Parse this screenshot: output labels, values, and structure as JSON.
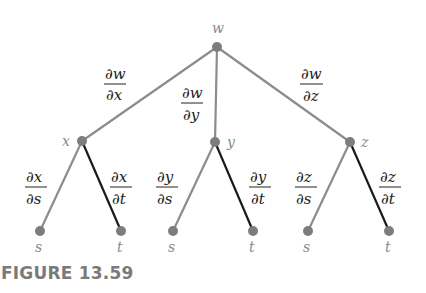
{
  "diagram": {
    "type": "tree-diagram",
    "colors": {
      "gray_edge": "#8c8c8c",
      "dark_edge": "#1a1a1a",
      "node_fill": "#7d7d7d",
      "label": "#8a8a8a",
      "fraction": "#222222",
      "caption": "#7a7a7a"
    },
    "root": {
      "label": "w"
    },
    "level1": [
      {
        "label": "x",
        "edge_num": "∂w",
        "edge_den": "∂x"
      },
      {
        "label": "y",
        "edge_num": "∂w",
        "edge_den": "∂y"
      },
      {
        "label": "z",
        "edge_num": "∂w",
        "edge_den": "∂z"
      }
    ],
    "level2": [
      {
        "parent": "x",
        "label": "s",
        "edge_num": "∂x",
        "edge_den": "∂s"
      },
      {
        "parent": "x",
        "label": "t",
        "edge_num": "∂x",
        "edge_den": "∂t"
      },
      {
        "parent": "y",
        "label": "s",
        "edge_num": "∂y",
        "edge_den": "∂s"
      },
      {
        "parent": "y",
        "label": "t",
        "edge_num": "∂y",
        "edge_den": "∂t"
      },
      {
        "parent": "z",
        "label": "s",
        "edge_num": "∂z",
        "edge_den": "∂s"
      },
      {
        "parent": "z",
        "label": "t",
        "edge_num": "∂z",
        "edge_den": "∂t"
      }
    ]
  },
  "caption": "FIGURE 13.59"
}
